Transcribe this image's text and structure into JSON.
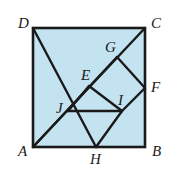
{
  "figure": {
    "type": "geometric-diagram",
    "canvas": {
      "width": 179,
      "height": 172
    },
    "colors": {
      "fill": "#c3e3f0",
      "stroke": "#1a1a1a",
      "background": "#ffffff",
      "label": "#1a1a1a"
    },
    "square": {
      "name": "ABCD",
      "left": 33,
      "top": 28,
      "right": 145,
      "bottom": 147,
      "stroke_width": 2.6
    },
    "points": {
      "A": {
        "x": 33,
        "y": 147
      },
      "B": {
        "x": 145,
        "y": 147
      },
      "C": {
        "x": 145,
        "y": 28
      },
      "D": {
        "x": 33,
        "y": 28
      },
      "E": {
        "x": 89,
        "y": 86
      },
      "F": {
        "x": 145,
        "y": 88
      },
      "G": {
        "x": 117,
        "y": 57
      },
      "H": {
        "x": 96,
        "y": 147
      },
      "I": {
        "x": 122,
        "y": 111
      },
      "J": {
        "x": 68,
        "y": 111
      }
    },
    "segments": [
      {
        "name": "diagonal-A-C",
        "from": "A",
        "to": "C"
      },
      {
        "name": "segment-D-H",
        "from": "D",
        "to": "H"
      },
      {
        "name": "segment-G-F",
        "from": "G",
        "to": "F"
      },
      {
        "name": "segment-F-I",
        "from": "F",
        "to": "I"
      },
      {
        "name": "segment-E-I",
        "from": "E",
        "to": "I"
      },
      {
        "name": "segment-E-J",
        "from": "E",
        "to": "J"
      },
      {
        "name": "segment-J-I",
        "from": "J",
        "to": "I"
      },
      {
        "name": "segment-A-G",
        "from": "A",
        "to": "G"
      },
      {
        "name": "segment-H-I",
        "from": "H",
        "to": "I"
      }
    ],
    "labels": [
      {
        "id": "A",
        "text": "A",
        "x": 18,
        "y": 144
      },
      {
        "id": "B",
        "text": "B",
        "x": 152,
        "y": 144
      },
      {
        "id": "C",
        "text": "C",
        "x": 151,
        "y": 16
      },
      {
        "id": "D",
        "text": "D",
        "x": 18,
        "y": 16
      },
      {
        "id": "E",
        "text": "E",
        "x": 81,
        "y": 68
      },
      {
        "id": "F",
        "text": "F",
        "x": 151,
        "y": 80
      },
      {
        "id": "G",
        "text": "G",
        "x": 105,
        "y": 40
      },
      {
        "id": "H",
        "text": "H",
        "x": 90,
        "y": 152
      },
      {
        "id": "I",
        "text": "I",
        "x": 118,
        "y": 93
      },
      {
        "id": "J",
        "text": "J",
        "x": 56,
        "y": 101
      }
    ]
  }
}
